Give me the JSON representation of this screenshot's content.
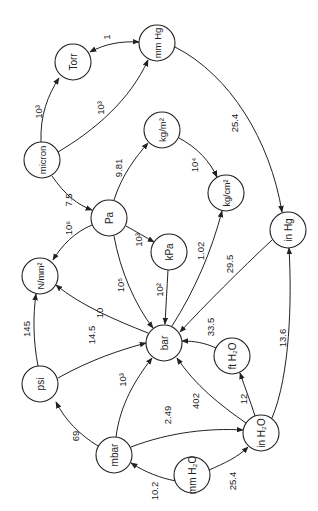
{
  "diagram": {
    "orientation": "rotated 90deg counter-clockwise",
    "nodes": [
      {
        "id": "torr",
        "label": "Torr",
        "x": 73,
        "y": 62
      },
      {
        "id": "mmhg",
        "label": "mm Hg",
        "x": 157,
        "y": 43
      },
      {
        "id": "micron",
        "label": "micron",
        "x": 42,
        "y": 160
      },
      {
        "id": "kgm2",
        "label": "kg/m²",
        "x": 162,
        "y": 130
      },
      {
        "id": "pa",
        "label": "Pa",
        "x": 109,
        "y": 218
      },
      {
        "id": "kgcm2",
        "label": "kg/cm²",
        "x": 226,
        "y": 193
      },
      {
        "id": "kpa",
        "label": "kPa",
        "x": 169,
        "y": 252
      },
      {
        "id": "inhg",
        "label": "in Hg",
        "x": 288,
        "y": 230
      },
      {
        "id": "nmm2",
        "label": "N/mm²",
        "x": 40,
        "y": 276
      },
      {
        "id": "bar",
        "label": "bar",
        "x": 164,
        "y": 343
      },
      {
        "id": "psi",
        "label": "psi",
        "x": 40,
        "y": 384
      },
      {
        "id": "fth2o",
        "label": "ft H₂O",
        "x": 232,
        "y": 356
      },
      {
        "id": "mbar",
        "label": "mbar",
        "x": 114,
        "y": 455
      },
      {
        "id": "inh2o",
        "label": "in H₂O",
        "x": 261,
        "y": 433
      },
      {
        "id": "mmh2o",
        "label": "mm H₂O",
        "x": 192,
        "y": 475
      }
    ],
    "edges": [
      {
        "from": "micron",
        "to": "torr",
        "label": "10³"
      },
      {
        "from": "micron",
        "to": "mmhg",
        "label": "10³"
      },
      {
        "from": "torr",
        "to": "mmhg",
        "label": "1",
        "bidirectional": true
      },
      {
        "from": "mmhg",
        "to": "inhg",
        "label": "25.4"
      },
      {
        "from": "micron",
        "to": "pa",
        "label": "7.5"
      },
      {
        "from": "pa",
        "to": "kgm2",
        "label": "9.81"
      },
      {
        "from": "kgm2",
        "to": "kgcm2",
        "label": "10⁴"
      },
      {
        "from": "pa",
        "to": "nmm2",
        "label": "10⁶"
      },
      {
        "from": "pa",
        "to": "kpa",
        "label": "10³"
      },
      {
        "from": "pa",
        "to": "bar",
        "label": "10⁵"
      },
      {
        "from": "kpa",
        "to": "bar",
        "label": "10²"
      },
      {
        "from": "bar",
        "to": "kgcm2",
        "label": "1.02"
      },
      {
        "from": "inhg",
        "to": "bar",
        "label": "29.5"
      },
      {
        "from": "bar",
        "to": "nmm2",
        "label": "10"
      },
      {
        "from": "psi",
        "to": "nmm2",
        "label": "145"
      },
      {
        "from": "psi",
        "to": "bar",
        "label": "14.5"
      },
      {
        "from": "fth2o",
        "to": "bar",
        "label": "33.5"
      },
      {
        "from": "inh2o",
        "to": "inhg",
        "label": "13.6"
      },
      {
        "from": "mbar",
        "to": "bar",
        "label": "10³"
      },
      {
        "from": "inh2o",
        "to": "bar",
        "label": "402"
      },
      {
        "from": "inh2o",
        "to": "fth2o",
        "label": "12"
      },
      {
        "from": "mbar",
        "to": "psi",
        "label": "69"
      },
      {
        "from": "mbar",
        "to": "inh2o",
        "label": "2.49"
      },
      {
        "from": "mmh2o",
        "to": "mbar",
        "label": "10.2"
      },
      {
        "from": "mmh2o",
        "to": "inh2o",
        "label": "25.4"
      }
    ]
  },
  "colors": {
    "stroke": "#222222",
    "background": "#ffffff"
  }
}
